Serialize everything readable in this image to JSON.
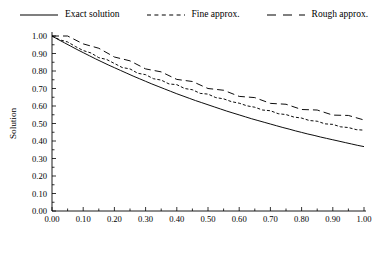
{
  "chart_data": {
    "type": "line",
    "title": "",
    "xlabel": "Time",
    "ylabel": "Solution",
    "xlim": [
      0.0,
      1.0
    ],
    "ylim": [
      0.0,
      1.0
    ],
    "grid": false,
    "legend_position": "top-outside",
    "xticks": [
      "0.00",
      "0.10",
      "0.20",
      "0.30",
      "0.40",
      "0.50",
      "0.60",
      "0.70",
      "0.80",
      "0.90",
      "1.00"
    ],
    "xtick_values": [
      0.0,
      0.1,
      0.2,
      0.3,
      0.4,
      0.5,
      0.6,
      0.7,
      0.8,
      0.9,
      1.0
    ],
    "yticks": [
      "0.00",
      "0.10",
      "0.20",
      "0.30",
      "0.40",
      "0.50",
      "0.60",
      "0.70",
      "0.80",
      "0.90",
      "1.00"
    ],
    "ytick_values": [
      0.0,
      0.1,
      0.2,
      0.3,
      0.4,
      0.5,
      0.6,
      0.7,
      0.8,
      0.9,
      1.0
    ],
    "series": [
      {
        "name": "Exact solution",
        "style": "solid",
        "dash": "none",
        "color": "#000000",
        "x": [
          0.0,
          0.02,
          0.04,
          0.06,
          0.08,
          0.1,
          0.12,
          0.14,
          0.16,
          0.18,
          0.2,
          0.22,
          0.24,
          0.26,
          0.28,
          0.3,
          0.32,
          0.34,
          0.36,
          0.38,
          0.4,
          0.42,
          0.44,
          0.46,
          0.48,
          0.5,
          0.52,
          0.54,
          0.56,
          0.58,
          0.6,
          0.62,
          0.64,
          0.66,
          0.68,
          0.7,
          0.72,
          0.74,
          0.76,
          0.78,
          0.8,
          0.82,
          0.84,
          0.86,
          0.88,
          0.9,
          0.92,
          0.94,
          0.96,
          0.98,
          1.0
        ],
        "values": [
          1.0,
          0.98,
          0.961,
          0.942,
          0.923,
          0.905,
          0.887,
          0.869,
          0.852,
          0.835,
          0.819,
          0.803,
          0.787,
          0.771,
          0.756,
          0.741,
          0.726,
          0.712,
          0.698,
          0.684,
          0.67,
          0.657,
          0.644,
          0.631,
          0.619,
          0.607,
          0.595,
          0.583,
          0.571,
          0.56,
          0.549,
          0.538,
          0.527,
          0.517,
          0.507,
          0.497,
          0.487,
          0.477,
          0.468,
          0.458,
          0.449,
          0.44,
          0.432,
          0.423,
          0.415,
          0.407,
          0.399,
          0.391,
          0.383,
          0.375,
          0.368
        ]
      },
      {
        "name": "Fine approx.",
        "style": "dashed-short",
        "dash": "3,2",
        "color": "#000000",
        "x": [
          0.0,
          0.025,
          0.05,
          0.075,
          0.1,
          0.125,
          0.15,
          0.175,
          0.2,
          0.225,
          0.25,
          0.275,
          0.3,
          0.325,
          0.35,
          0.375,
          0.4,
          0.425,
          0.45,
          0.475,
          0.5,
          0.525,
          0.55,
          0.575,
          0.6,
          0.625,
          0.65,
          0.675,
          0.7,
          0.725,
          0.75,
          0.775,
          0.8,
          0.825,
          0.85,
          0.875,
          0.9,
          0.925,
          0.95,
          0.975,
          1.0
        ],
        "values": [
          1.0,
          0.978,
          0.966,
          0.94,
          0.917,
          0.903,
          0.876,
          0.866,
          0.843,
          0.82,
          0.812,
          0.787,
          0.779,
          0.756,
          0.748,
          0.726,
          0.722,
          0.7,
          0.693,
          0.672,
          0.668,
          0.648,
          0.641,
          0.625,
          0.616,
          0.601,
          0.593,
          0.577,
          0.573,
          0.556,
          0.551,
          0.537,
          0.531,
          0.517,
          0.513,
          0.498,
          0.495,
          0.481,
          0.477,
          0.465,
          0.462
        ]
      },
      {
        "name": "Rough approx.",
        "style": "dashed-long",
        "dash": "7,4",
        "color": "#000000",
        "x": [
          0.0,
          0.05,
          0.1,
          0.15,
          0.2,
          0.25,
          0.3,
          0.35,
          0.4,
          0.45,
          0.5,
          0.55,
          0.6,
          0.65,
          0.7,
          0.75,
          0.8,
          0.85,
          0.9,
          0.95,
          1.0
        ],
        "values": [
          1.0,
          1.0,
          0.955,
          0.93,
          0.88,
          0.858,
          0.812,
          0.795,
          0.752,
          0.74,
          0.7,
          0.69,
          0.655,
          0.648,
          0.615,
          0.61,
          0.58,
          0.577,
          0.548,
          0.546,
          0.52
        ]
      }
    ]
  },
  "legend": {
    "items": [
      {
        "label": "Exact solution",
        "key": "solid-line-key"
      },
      {
        "label": "Fine approx.",
        "key": "short-dash-line-key"
      },
      {
        "label": "Rough approx.",
        "key": "long-dash-line-key"
      }
    ]
  }
}
